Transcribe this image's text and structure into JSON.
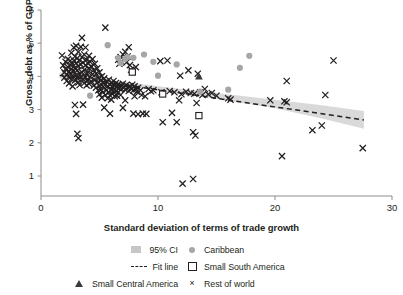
{
  "chart_data": {
    "type": "scatter",
    "title": "",
    "xlabel": "Standard deviation of terms of trade growth",
    "ylabel": "Gross debt as % of GDP",
    "xlim": [
      0,
      30
    ],
    "ylim": [
      0,
      6
    ],
    "xticks": [
      0,
      10,
      20,
      30
    ],
    "yticks": [
      1,
      2,
      3,
      4,
      5,
      6
    ],
    "grid": false,
    "legend_position": "below-axes",
    "legend": [
      {
        "label": "95% CI",
        "marker": "band",
        "color": "#c6c6c6"
      },
      {
        "label": "Caribbean",
        "marker": "circle",
        "color": "#a6a6a6"
      },
      {
        "label": "Fit line",
        "marker": "dashed-line",
        "color": "#231f20"
      },
      {
        "label": "Small South America",
        "marker": "open-square",
        "color": "#231f20"
      },
      {
        "label": "Small Central America",
        "marker": "triangle",
        "color": "#3a3a3a"
      },
      {
        "label": "Rest of world",
        "marker": "x",
        "color": "#231f20"
      }
    ],
    "fit_line": {
      "label": "Fit line",
      "style": "dashed",
      "x": [
        1.6,
        27.6
      ],
      "y": [
        4.03,
        2.69
      ]
    },
    "confidence_interval": {
      "label": "95% CI",
      "level": 0.95,
      "x": [
        1.6,
        5.0,
        10.0,
        15.0,
        20.0,
        24.0,
        27.6
      ],
      "upper": [
        4.12,
        3.93,
        3.7,
        3.5,
        3.3,
        3.13,
        2.96
      ],
      "lower": [
        3.94,
        3.79,
        3.58,
        3.33,
        3.04,
        2.73,
        2.42
      ]
    },
    "series": [
      {
        "name": "Rest of world",
        "marker": "x",
        "color": "#231f20",
        "points": [
          [
            1.8,
            4.63
          ],
          [
            1.9,
            4.33
          ],
          [
            2.0,
            4.12
          ],
          [
            2.0,
            3.96
          ],
          [
            2.1,
            4.44
          ],
          [
            2.1,
            4.22
          ],
          [
            2.2,
            4.05
          ],
          [
            2.2,
            3.86
          ],
          [
            2.3,
            4.52
          ],
          [
            2.3,
            4.28
          ],
          [
            2.4,
            4.15
          ],
          [
            2.4,
            3.99
          ],
          [
            2.4,
            3.79
          ],
          [
            2.5,
            4.47
          ],
          [
            2.5,
            4.35
          ],
          [
            2.5,
            4.09
          ],
          [
            2.6,
            4.71
          ],
          [
            2.6,
            4.22
          ],
          [
            2.6,
            3.92
          ],
          [
            2.7,
            4.38
          ],
          [
            2.7,
            4.02
          ],
          [
            2.7,
            3.7
          ],
          [
            2.8,
            4.87
          ],
          [
            2.8,
            4.48
          ],
          [
            2.8,
            4.16
          ],
          [
            2.9,
            4.6
          ],
          [
            2.9,
            4.25
          ],
          [
            2.9,
            3.88
          ],
          [
            2.9,
            3.14
          ],
          [
            3.0,
            4.92
          ],
          [
            3.0,
            4.4
          ],
          [
            3.0,
            4.03
          ],
          [
            3.0,
            2.87
          ],
          [
            3.1,
            4.55
          ],
          [
            3.1,
            4.18
          ],
          [
            3.1,
            3.95
          ],
          [
            3.1,
            2.27
          ],
          [
            3.2,
            4.74
          ],
          [
            3.2,
            4.31
          ],
          [
            3.2,
            3.82
          ],
          [
            3.2,
            2.14
          ],
          [
            3.3,
            4.48
          ],
          [
            3.3,
            4.08
          ],
          [
            3.3,
            3.74
          ],
          [
            3.4,
            4.89
          ],
          [
            3.4,
            4.36
          ],
          [
            3.4,
            3.99
          ],
          [
            3.5,
            5.16
          ],
          [
            3.5,
            4.58
          ],
          [
            3.5,
            4.12
          ],
          [
            3.6,
            4.42
          ],
          [
            3.6,
            3.91
          ],
          [
            3.6,
            3.15
          ],
          [
            3.7,
            4.66
          ],
          [
            3.7,
            4.2
          ],
          [
            3.7,
            3.8
          ],
          [
            3.8,
            4.87
          ],
          [
            3.8,
            4.33
          ],
          [
            3.8,
            3.97
          ],
          [
            3.9,
            4.5
          ],
          [
            3.9,
            4.06
          ],
          [
            3.9,
            3.73
          ],
          [
            4.0,
            4.4
          ],
          [
            4.0,
            4.14
          ],
          [
            4.0,
            3.88
          ],
          [
            4.1,
            4.62
          ],
          [
            4.1,
            4.25
          ],
          [
            4.1,
            3.78
          ],
          [
            4.2,
            4.44
          ],
          [
            4.2,
            3.99
          ],
          [
            4.3,
            4.3
          ],
          [
            4.3,
            3.85
          ],
          [
            4.4,
            4.52
          ],
          [
            4.4,
            4.06
          ],
          [
            4.5,
            4.19
          ],
          [
            4.5,
            3.72
          ],
          [
            4.6,
            4.38
          ],
          [
            4.6,
            3.9
          ],
          [
            4.7,
            4.08
          ],
          [
            4.7,
            3.66
          ],
          [
            4.8,
            4.24
          ],
          [
            4.8,
            3.8
          ],
          [
            4.9,
            3.95
          ],
          [
            4.9,
            3.58
          ],
          [
            5.0,
            4.12
          ],
          [
            5.0,
            3.72
          ],
          [
            5.0,
            3.46
          ],
          [
            5.1,
            3.88
          ],
          [
            5.1,
            3.6
          ],
          [
            5.2,
            4.0
          ],
          [
            5.2,
            3.74
          ],
          [
            5.2,
            3.36
          ],
          [
            5.3,
            3.82
          ],
          [
            5.3,
            3.52
          ],
          [
            5.4,
            3.94
          ],
          [
            5.4,
            3.65
          ],
          [
            5.4,
            3.06
          ],
          [
            5.5,
            3.76
          ],
          [
            5.5,
            3.44
          ],
          [
            5.6,
            3.85
          ],
          [
            5.6,
            3.58
          ],
          [
            5.7,
            3.7
          ],
          [
            5.7,
            3.34
          ],
          [
            5.8,
            3.9
          ],
          [
            5.8,
            3.52
          ],
          [
            5.9,
            3.74
          ],
          [
            5.9,
            3.43
          ],
          [
            5.9,
            2.88
          ],
          [
            5.5,
            5.47
          ],
          [
            6.0,
            3.8
          ],
          [
            6.0,
            3.6
          ],
          [
            6.0,
            3.3
          ],
          [
            6.1,
            3.7
          ],
          [
            6.1,
            3.48
          ],
          [
            6.2,
            3.86
          ],
          [
            6.2,
            3.58
          ],
          [
            6.3,
            3.72
          ],
          [
            6.3,
            3.4
          ],
          [
            6.4,
            3.8
          ],
          [
            6.4,
            3.56
          ],
          [
            6.5,
            3.68
          ],
          [
            6.5,
            3.42
          ],
          [
            6.6,
            4.5
          ],
          [
            6.6,
            3.76
          ],
          [
            6.6,
            3.52
          ],
          [
            6.7,
            4.38
          ],
          [
            6.7,
            3.64
          ],
          [
            6.8,
            4.58
          ],
          [
            6.8,
            3.72
          ],
          [
            6.8,
            3.44
          ],
          [
            6.9,
            4.44
          ],
          [
            6.9,
            3.62
          ],
          [
            7.0,
            4.66
          ],
          [
            7.0,
            3.78
          ],
          [
            7.0,
            3.05
          ],
          [
            7.1,
            4.52
          ],
          [
            7.1,
            3.68
          ],
          [
            7.2,
            4.74
          ],
          [
            7.2,
            3.6
          ],
          [
            7.2,
            3.28
          ],
          [
            7.3,
            4.42
          ],
          [
            7.3,
            3.74
          ],
          [
            7.4,
            4.6
          ],
          [
            7.4,
            3.66
          ],
          [
            7.5,
            4.88
          ],
          [
            7.5,
            3.56
          ],
          [
            7.6,
            4.34
          ],
          [
            7.6,
            3.7
          ],
          [
            7.7,
            4.2
          ],
          [
            7.7,
            3.62
          ],
          [
            7.8,
            3.75
          ],
          [
            7.9,
            3.58
          ],
          [
            7.9,
            2.88
          ],
          [
            8.0,
            3.7
          ],
          [
            8.0,
            3.4
          ],
          [
            8.1,
            4.28
          ],
          [
            8.1,
            3.62
          ],
          [
            8.2,
            3.54
          ],
          [
            8.3,
            3.66
          ],
          [
            8.3,
            2.86
          ],
          [
            8.5,
            3.58
          ],
          [
            8.6,
            3.44
          ],
          [
            8.7,
            2.88
          ],
          [
            8.9,
            3.4
          ],
          [
            9.0,
            2.87
          ],
          [
            9.2,
            3.62
          ],
          [
            9.4,
            3.55
          ],
          [
            9.6,
            3.58
          ],
          [
            10.2,
            4.46
          ],
          [
            10.3,
            3.52
          ],
          [
            10.4,
            2.62
          ],
          [
            10.8,
            4.48
          ],
          [
            11.0,
            3.56
          ],
          [
            11.2,
            2.9
          ],
          [
            11.4,
            3.52
          ],
          [
            11.6,
            2.62
          ],
          [
            11.8,
            3.28
          ],
          [
            11.9,
            4.02
          ],
          [
            12.0,
            3.46
          ],
          [
            12.1,
            0.77
          ],
          [
            12.4,
            3.54
          ],
          [
            12.6,
            4.18
          ],
          [
            12.8,
            3.5
          ],
          [
            13.0,
            2.32
          ],
          [
            13.0,
            0.91
          ],
          [
            13.1,
            3.48
          ],
          [
            13.2,
            2.22
          ],
          [
            13.3,
            3.2
          ],
          [
            13.4,
            4.08
          ],
          [
            13.6,
            3.52
          ],
          [
            13.8,
            3.44
          ],
          [
            14.0,
            3.62
          ],
          [
            14.3,
            3.46
          ],
          [
            14.6,
            3.5
          ],
          [
            15.0,
            3.42
          ],
          [
            16.0,
            3.34
          ],
          [
            16.2,
            3.3
          ],
          [
            19.6,
            3.28
          ],
          [
            20.6,
            1.6
          ],
          [
            20.8,
            3.25
          ],
          [
            21.0,
            3.22
          ],
          [
            21.0,
            3.86
          ],
          [
            23.2,
            2.38
          ],
          [
            24.0,
            2.52
          ],
          [
            24.3,
            3.44
          ],
          [
            25.0,
            4.48
          ],
          [
            27.5,
            1.84
          ]
        ]
      },
      {
        "name": "Caribbean",
        "marker": "circle",
        "color": "#a6a6a6",
        "points": [
          [
            4.2,
            3.42
          ],
          [
            5.7,
            4.94
          ],
          [
            6.6,
            4.55
          ],
          [
            6.8,
            4.4
          ],
          [
            7.2,
            4.52
          ],
          [
            7.4,
            4.58
          ],
          [
            7.9,
            4.56
          ],
          [
            8.8,
            4.66
          ],
          [
            9.6,
            4.44
          ],
          [
            10.0,
            4.02
          ],
          [
            11.6,
            4.36
          ],
          [
            13.6,
            3.54
          ],
          [
            16.0,
            3.6
          ],
          [
            17.0,
            4.26
          ],
          [
            17.8,
            4.62
          ]
        ]
      },
      {
        "name": "Small South America",
        "marker": "open-square",
        "color": "#231f20",
        "points": [
          [
            7.8,
            4.13
          ],
          [
            10.4,
            3.47
          ],
          [
            13.5,
            2.82
          ]
        ]
      },
      {
        "name": "Small Central America",
        "marker": "triangle",
        "color": "#3a3a3a",
        "points": [
          [
            13.5,
            4.0
          ]
        ]
      }
    ]
  }
}
